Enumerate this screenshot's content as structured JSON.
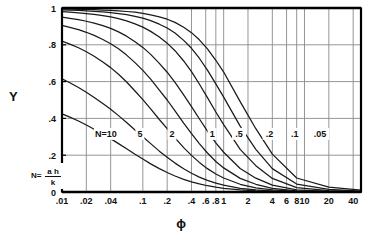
{
  "chart_data": {
    "type": "line",
    "title": "",
    "xlabel": "ϕ",
    "ylabel": "Y",
    "xscale": "log",
    "yscale": "linear",
    "xlim": [
      0.01,
      50
    ],
    "ylim": [
      0,
      1
    ],
    "grid": true,
    "legend_position": "inline-curve-labels",
    "x_ticks": [
      {
        "value": 0.01,
        "label": ".01"
      },
      {
        "value": 0.02,
        "label": ".02"
      },
      {
        "value": 0.04,
        "label": ".04"
      },
      {
        "value": 0.1,
        "label": ".1"
      },
      {
        "value": 0.2,
        "label": ".2"
      },
      {
        "value": 0.4,
        "label": ".4"
      },
      {
        "value": 0.6,
        "label": ".6"
      },
      {
        "value": 0.8,
        "label": ".8"
      },
      {
        "value": 1,
        "label": "1"
      },
      {
        "value": 2,
        "label": "2"
      },
      {
        "value": 4,
        "label": "4"
      },
      {
        "value": 6,
        "label": "6"
      },
      {
        "value": 8,
        "label": "8"
      },
      {
        "value": 10,
        "label": "10"
      },
      {
        "value": 20,
        "label": "20"
      },
      {
        "value": 40,
        "label": "40"
      }
    ],
    "y_ticks": [
      {
        "value": 0,
        "label": "0"
      },
      {
        "value": 0.2,
        "label": ".2"
      },
      {
        "value": 0.4,
        "label": ".4"
      },
      {
        "value": 0.6,
        "label": ".6"
      },
      {
        "value": 0.8,
        "label": ".8"
      },
      {
        "value": 1,
        "label": "1"
      }
    ],
    "annotation_formula": {
      "lead": "N=",
      "numerator": "a h",
      "denominator": "k"
    },
    "series": [
      {
        "name": "N=10",
        "label": "N=10",
        "label_x": 0.035,
        "label_y": 0.305,
        "N": 10,
        "points": [
          [
            0.01,
            0.425
          ],
          [
            0.0125,
            0.407
          ],
          [
            0.016,
            0.386
          ],
          [
            0.02,
            0.364
          ],
          [
            0.025,
            0.341
          ],
          [
            0.032,
            0.315
          ],
          [
            0.04,
            0.29
          ],
          [
            0.05,
            0.263
          ],
          [
            0.063,
            0.235
          ],
          [
            0.08,
            0.205
          ],
          [
            0.1,
            0.179
          ],
          [
            0.125,
            0.153
          ],
          [
            0.16,
            0.127
          ],
          [
            0.2,
            0.106
          ],
          [
            0.25,
            0.087
          ],
          [
            0.32,
            0.069
          ],
          [
            0.4,
            0.055
          ],
          [
            0.5,
            0.044
          ],
          [
            0.63,
            0.034
          ],
          [
            0.8,
            0.026
          ],
          [
            1.0,
            0.02
          ],
          [
            1.6,
            0.011
          ],
          [
            2.5,
            0.006
          ],
          [
            4,
            0.003
          ],
          [
            8,
            0.001
          ],
          [
            20,
            0.0005
          ],
          [
            50,
            0.0002
          ]
        ]
      },
      {
        "name": "5",
        "label": "5",
        "label_x": 0.092,
        "label_y": 0.305,
        "N": 5,
        "points": [
          [
            0.01,
            0.615
          ],
          [
            0.0125,
            0.594
          ],
          [
            0.016,
            0.568
          ],
          [
            0.02,
            0.542
          ],
          [
            0.025,
            0.514
          ],
          [
            0.032,
            0.481
          ],
          [
            0.04,
            0.45
          ],
          [
            0.05,
            0.415
          ],
          [
            0.063,
            0.378
          ],
          [
            0.08,
            0.337
          ],
          [
            0.1,
            0.3
          ],
          [
            0.125,
            0.263
          ],
          [
            0.16,
            0.222
          ],
          [
            0.2,
            0.189
          ],
          [
            0.25,
            0.157
          ],
          [
            0.32,
            0.126
          ],
          [
            0.4,
            0.102
          ],
          [
            0.5,
            0.081
          ],
          [
            0.63,
            0.063
          ],
          [
            0.8,
            0.048
          ],
          [
            1.0,
            0.037
          ],
          [
            1.6,
            0.02
          ],
          [
            2.5,
            0.011
          ],
          [
            4,
            0.005
          ],
          [
            8,
            0.0015
          ],
          [
            20,
            0.0006
          ],
          [
            50,
            0.0002
          ]
        ]
      },
      {
        "name": "2",
        "label": "2",
        "label_x": 0.23,
        "label_y": 0.305,
        "N": 2,
        "points": [
          [
            0.01,
            0.82
          ],
          [
            0.0125,
            0.804
          ],
          [
            0.016,
            0.784
          ],
          [
            0.02,
            0.762
          ],
          [
            0.025,
            0.738
          ],
          [
            0.032,
            0.707
          ],
          [
            0.04,
            0.676
          ],
          [
            0.05,
            0.64
          ],
          [
            0.063,
            0.598
          ],
          [
            0.08,
            0.549
          ],
          [
            0.1,
            0.502
          ],
          [
            0.125,
            0.452
          ],
          [
            0.16,
            0.394
          ],
          [
            0.2,
            0.344
          ],
          [
            0.25,
            0.294
          ],
          [
            0.32,
            0.241
          ],
          [
            0.4,
            0.199
          ],
          [
            0.5,
            0.161
          ],
          [
            0.63,
            0.127
          ],
          [
            0.8,
            0.098
          ],
          [
            1.0,
            0.076
          ],
          [
            1.6,
            0.042
          ],
          [
            2.5,
            0.023
          ],
          [
            4,
            0.011
          ],
          [
            8,
            0.003
          ],
          [
            20,
            0.001
          ],
          [
            50,
            0.0004
          ]
        ]
      },
      {
        "name": "1",
        "label": "1",
        "label_x": 0.72,
        "label_y": 0.305,
        "N": 1,
        "points": [
          [
            0.01,
            0.905
          ],
          [
            0.0125,
            0.895
          ],
          [
            0.016,
            0.882
          ],
          [
            0.02,
            0.868
          ],
          [
            0.025,
            0.851
          ],
          [
            0.032,
            0.829
          ],
          [
            0.04,
            0.806
          ],
          [
            0.05,
            0.778
          ],
          [
            0.063,
            0.744
          ],
          [
            0.08,
            0.703
          ],
          [
            0.1,
            0.661
          ],
          [
            0.125,
            0.613
          ],
          [
            0.16,
            0.554
          ],
          [
            0.2,
            0.5
          ],
          [
            0.25,
            0.441
          ],
          [
            0.32,
            0.374
          ],
          [
            0.4,
            0.317
          ],
          [
            0.5,
            0.263
          ],
          [
            0.63,
            0.212
          ],
          [
            0.8,
            0.166
          ],
          [
            1.0,
            0.131
          ],
          [
            1.6,
            0.074
          ],
          [
            2.5,
            0.042
          ],
          [
            4,
            0.02
          ],
          [
            8,
            0.006
          ],
          [
            20,
            0.002
          ],
          [
            50,
            0.0007
          ]
        ]
      },
      {
        "name": ".5",
        "label": ".5",
        "label_x": 1.55,
        "label_y": 0.305,
        "N": 0.5,
        "points": [
          [
            0.01,
            0.95
          ],
          [
            0.0125,
            0.944
          ],
          [
            0.016,
            0.937
          ],
          [
            0.02,
            0.928
          ],
          [
            0.025,
            0.918
          ],
          [
            0.032,
            0.904
          ],
          [
            0.04,
            0.889
          ],
          [
            0.05,
            0.87
          ],
          [
            0.063,
            0.847
          ],
          [
            0.08,
            0.817
          ],
          [
            0.1,
            0.786
          ],
          [
            0.125,
            0.748
          ],
          [
            0.16,
            0.699
          ],
          [
            0.2,
            0.651
          ],
          [
            0.25,
            0.596
          ],
          [
            0.32,
            0.528
          ],
          [
            0.4,
            0.464
          ],
          [
            0.5,
            0.398
          ],
          [
            0.63,
            0.331
          ],
          [
            0.8,
            0.267
          ],
          [
            1.0,
            0.216
          ],
          [
            1.6,
            0.128
          ],
          [
            2.5,
            0.075
          ],
          [
            4,
            0.037
          ],
          [
            8,
            0.011
          ],
          [
            20,
            0.004
          ],
          [
            50,
            0.0013
          ]
        ]
      },
      {
        "name": ".2",
        "label": ".2",
        "label_x": 3.7,
        "label_y": 0.305,
        "N": 0.2,
        "points": [
          [
            0.01,
            0.98
          ],
          [
            0.0125,
            0.977
          ],
          [
            0.016,
            0.974
          ],
          [
            0.02,
            0.97
          ],
          [
            0.025,
            0.965
          ],
          [
            0.032,
            0.959
          ],
          [
            0.04,
            0.952
          ],
          [
            0.05,
            0.942
          ],
          [
            0.063,
            0.93
          ],
          [
            0.08,
            0.914
          ],
          [
            0.1,
            0.896
          ],
          [
            0.125,
            0.873
          ],
          [
            0.16,
            0.842
          ],
          [
            0.2,
            0.809
          ],
          [
            0.25,
            0.768
          ],
          [
            0.32,
            0.712
          ],
          [
            0.4,
            0.654
          ],
          [
            0.5,
            0.587
          ],
          [
            0.63,
            0.513
          ],
          [
            0.8,
            0.435
          ],
          [
            1.0,
            0.366
          ],
          [
            1.6,
            0.232
          ],
          [
            2.5,
            0.143
          ],
          [
            4,
            0.074
          ],
          [
            8,
            0.024
          ],
          [
            20,
            0.008
          ],
          [
            50,
            0.003
          ]
        ]
      },
      {
        "name": ".1",
        "label": ".1",
        "label_x": 7.6,
        "label_y": 0.305,
        "N": 0.1,
        "points": [
          [
            0.01,
            0.99
          ],
          [
            0.0125,
            0.988
          ],
          [
            0.016,
            0.987
          ],
          [
            0.02,
            0.985
          ],
          [
            0.025,
            0.982
          ],
          [
            0.032,
            0.979
          ],
          [
            0.04,
            0.975
          ],
          [
            0.05,
            0.97
          ],
          [
            0.063,
            0.964
          ],
          [
            0.08,
            0.955
          ],
          [
            0.1,
            0.945
          ],
          [
            0.125,
            0.931
          ],
          [
            0.16,
            0.912
          ],
          [
            0.2,
            0.891
          ],
          [
            0.25,
            0.864
          ],
          [
            0.32,
            0.824
          ],
          [
            0.4,
            0.781
          ],
          [
            0.5,
            0.727
          ],
          [
            0.63,
            0.662
          ],
          [
            0.8,
            0.588
          ],
          [
            1.0,
            0.516
          ],
          [
            1.6,
            0.358
          ],
          [
            2.5,
            0.232
          ],
          [
            4,
            0.127
          ],
          [
            8,
            0.043
          ],
          [
            20,
            0.014
          ],
          [
            50,
            0.005
          ]
        ]
      },
      {
        "name": ".05",
        "label": ".05",
        "label_x": 15.5,
        "label_y": 0.305,
        "N": 0.05,
        "points": [
          [
            0.01,
            0.995
          ],
          [
            0.0125,
            0.994
          ],
          [
            0.016,
            0.993
          ],
          [
            0.02,
            0.992
          ],
          [
            0.025,
            0.991
          ],
          [
            0.032,
            0.989
          ],
          [
            0.04,
            0.987
          ],
          [
            0.05,
            0.985
          ],
          [
            0.063,
            0.981
          ],
          [
            0.08,
            0.977
          ],
          [
            0.1,
            0.971
          ],
          [
            0.125,
            0.963
          ],
          [
            0.16,
            0.952
          ],
          [
            0.2,
            0.939
          ],
          [
            0.25,
            0.922
          ],
          [
            0.32,
            0.895
          ],
          [
            0.4,
            0.866
          ],
          [
            0.5,
            0.827
          ],
          [
            0.63,
            0.778
          ],
          [
            0.8,
            0.716
          ],
          [
            1.0,
            0.652
          ],
          [
            1.6,
            0.491
          ],
          [
            2.5,
            0.344
          ],
          [
            4,
            0.206
          ],
          [
            8,
            0.076
          ],
          [
            20,
            0.026
          ],
          [
            50,
            0.01
          ]
        ]
      }
    ]
  },
  "colors": {
    "curve": "#1a1a1a",
    "grid": "#8a8a8a",
    "axis": "#000000",
    "text": "#111111",
    "background": "#ffffff"
  }
}
